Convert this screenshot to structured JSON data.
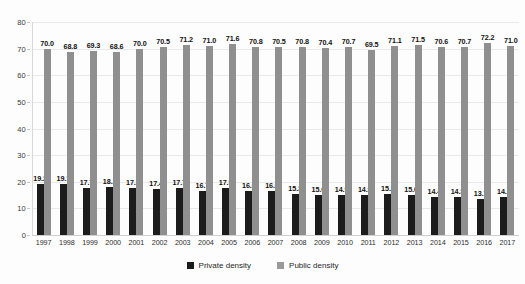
{
  "chart_data": {
    "type": "bar",
    "title": "",
    "subtitle": "",
    "xlabel": "",
    "ylabel": "",
    "ylim": [
      0,
      80
    ],
    "yticks": [
      0,
      10,
      20,
      30,
      40,
      50,
      60,
      70,
      80
    ],
    "grid": true,
    "legend_position": "bottom-center",
    "categories": [
      "1997",
      "1998",
      "1999",
      "2000",
      "2001",
      "2002",
      "2003",
      "2004",
      "2005",
      "2006",
      "2007",
      "2008",
      "2009",
      "2010",
      "2011",
      "2012",
      "2013",
      "2014",
      "2015",
      "2016",
      "2017"
    ],
    "series": [
      {
        "name": "Private density",
        "color": "#1c1c1c",
        "values": [
          19.2,
          19.1,
          17.7,
          18.1,
          17.5,
          17.4,
          17.7,
          16.7,
          17.5,
          16.6,
          16.6,
          15.3,
          15.0,
          14.9,
          14.9,
          15.3,
          15.0,
          14.4,
          14.3,
          13.7,
          14.2
        ],
        "labels": [
          "19.2",
          "19.1",
          "17.7",
          "18.1",
          "17.5",
          "17.4",
          "17.7",
          "16.7",
          "17.5",
          "16.6",
          "16.6",
          "15.3",
          "15.0",
          "14.9",
          "14.9",
          "15.3",
          "15.0",
          "14.4",
          "14.3",
          "13.7",
          "14.2"
        ]
      },
      {
        "name": "Public density",
        "color": "#8f8f8f",
        "values": [
          70.0,
          68.8,
          69.3,
          68.6,
          70.0,
          70.5,
          71.2,
          71.0,
          71.6,
          70.8,
          70.5,
          70.8,
          70.4,
          70.7,
          69.5,
          71.1,
          71.5,
          70.6,
          70.7,
          72.2,
          71.0
        ],
        "labels": [
          "70.0",
          "68.8",
          "69.3",
          "68.6",
          "70.0",
          "70.5",
          "71.2",
          "71.0",
          "71.6",
          "70.8",
          "70.5",
          "70.8",
          "70.4",
          "70.7",
          "69.5",
          "71.1",
          "71.5",
          "70.6",
          "70.7",
          "72.2",
          "71.0"
        ]
      }
    ],
    "ytick_labels": [
      "80",
      "70",
      "60",
      "50",
      "40",
      "30",
      "20",
      "10",
      "0"
    ],
    "legend": [
      {
        "label": "Private density",
        "color": "#1c1c1c"
      },
      {
        "label": "Public density",
        "color": "#9a9a9a"
      }
    ]
  }
}
